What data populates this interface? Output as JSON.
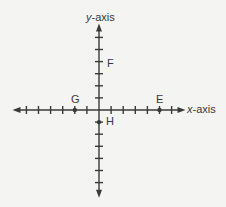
{
  "diagram": {
    "type": "coordinate-plane",
    "axes": {
      "x_label_var": "x",
      "x_label_suffix": "-axis",
      "y_label_var": "y",
      "y_label_suffix": "-axis",
      "x_range": [
        -6,
        6
      ],
      "y_range": [
        -7,
        6
      ],
      "tick_spacing": 1
    },
    "points": [
      {
        "label": "E",
        "x": 5,
        "y": 0,
        "dot": true
      },
      {
        "label": "F",
        "x": 0,
        "y": 4,
        "dot": false
      },
      {
        "label": "G",
        "x": -2,
        "y": 0,
        "dot": true
      },
      {
        "label": "H",
        "x": 0,
        "y": -1,
        "dot": true
      }
    ],
    "colors": {
      "axis": "#3a3a3a",
      "background": "#f4f4f2"
    }
  }
}
